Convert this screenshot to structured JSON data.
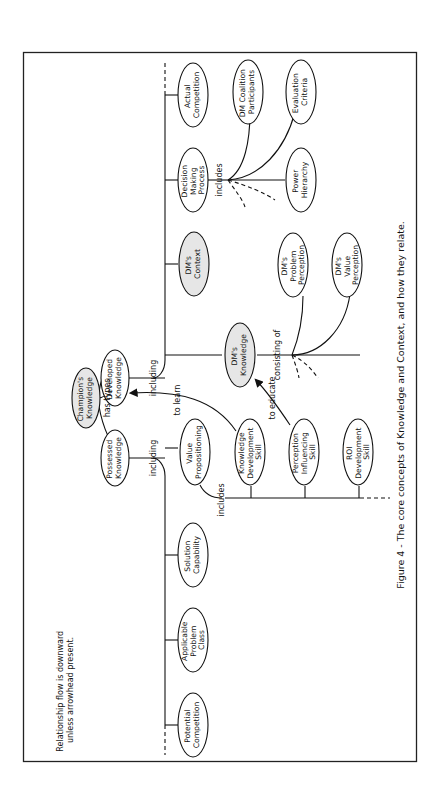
{
  "diagram": {
    "caption": "Figure 4 - The core concepts of Knowledge and Context, and how they relate.",
    "note_lines": [
      "Relationship flow is downward",
      "unless arrowhead present."
    ],
    "colors": {
      "shaded_node": "#e6e6e6",
      "plain_node": "#ffffff",
      "ink": "#111111"
    },
    "nodes": {
      "champions_knowledge": {
        "lines": [
          "Champion's",
          "Knowledge"
        ],
        "shaded": true
      },
      "possessed_knowledge": {
        "lines": [
          "Possessed",
          "Knowledge"
        ],
        "shaded": false
      },
      "developed_knowledge": {
        "lines": [
          "Developed",
          "Knowledge"
        ],
        "shaded": false
      },
      "actual_competition": {
        "lines": [
          "Actual",
          "Competition"
        ],
        "shaded": false
      },
      "decision_making_process": {
        "lines": [
          "Decision",
          "Making",
          "Process"
        ],
        "shaded": false
      },
      "dms_context": {
        "lines": [
          "DM's",
          "Context"
        ],
        "shaded": true
      },
      "dms_knowledge": {
        "lines": [
          "DM's",
          "Knowledge"
        ],
        "shaded": true
      },
      "dm_coalition_participants": {
        "lines": [
          "DM Coalition",
          "Participants"
        ],
        "shaded": false
      },
      "evaluation_criteria": {
        "lines": [
          "Evaluation",
          "Criteria"
        ],
        "shaded": false
      },
      "power_hierarchy": {
        "lines": [
          "Power",
          "Hierarchy"
        ],
        "shaded": false
      },
      "dms_problem_perception": {
        "lines": [
          "DM's",
          "Problem",
          "Perception"
        ],
        "shaded": false
      },
      "dms_value_perception": {
        "lines": [
          "DM's",
          "Value",
          "Perception"
        ],
        "shaded": false
      },
      "value_propositioning": {
        "lines": [
          "Value",
          "Propositioning"
        ],
        "shaded": false
      },
      "solution_capability": {
        "lines": [
          "Solution",
          "Capability"
        ],
        "shaded": false
      },
      "applicable_problem_class": {
        "lines": [
          "Applicable",
          "Problem",
          "Class"
        ],
        "shaded": false
      },
      "potential_competition": {
        "lines": [
          "Potential",
          "Competition"
        ],
        "shaded": false
      },
      "knowledge_development_skill": {
        "lines": [
          "Knowledge",
          "Development",
          "Skill"
        ],
        "shaded": false
      },
      "perception_influencing_skill": {
        "lines": [
          "Perception",
          "Influencing",
          "Skill"
        ],
        "shaded": false
      },
      "roi_development_skill": {
        "lines": [
          "ROI",
          "Development",
          "Skill"
        ],
        "shaded": false
      }
    },
    "edge_labels": {
      "has_types": "has types",
      "including_possessed": "including",
      "including_developed": "including",
      "includes_dmp": "includes",
      "consisting_of": "consisting of",
      "includes_value_prop": "includes",
      "to_learn": "to learn",
      "to_educate": "to educate"
    }
  }
}
